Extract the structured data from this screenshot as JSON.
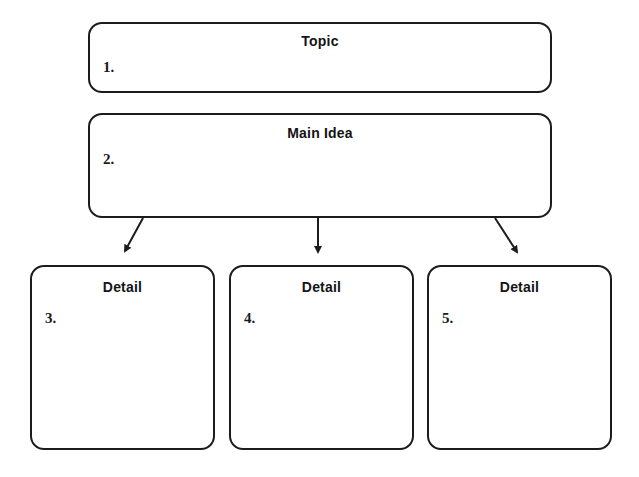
{
  "diagram": {
    "type": "graphic-organizer",
    "topic": {
      "title": "Topic",
      "number": "1."
    },
    "main_idea": {
      "title": "Main Idea",
      "number": "2."
    },
    "details": [
      {
        "title": "Detail",
        "number": "3."
      },
      {
        "title": "Detail",
        "number": "4."
      },
      {
        "title": "Detail",
        "number": "5."
      }
    ],
    "connections": [
      {
        "from": "main_idea",
        "to": "details.0"
      },
      {
        "from": "main_idea",
        "to": "details.1"
      },
      {
        "from": "main_idea",
        "to": "details.2"
      }
    ],
    "colors": {
      "stroke": "#1c1c1c",
      "background": "#ffffff",
      "text": "#141414"
    }
  }
}
